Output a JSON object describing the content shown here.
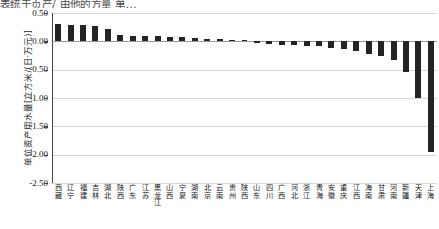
{
  "top_caption": "表统于页产/ 由他的方量 单...",
  "axes": {
    "ylabel": "单位资产用水量[立方米/(日·万元)]",
    "xlabel": "",
    "yticks": [
      0.5,
      0.0,
      -0.5,
      -1.0,
      -1.5,
      -2.0,
      -2.5
    ],
    "ytick_labels": [
      "0.50",
      "0.00",
      "-0.50",
      "-1.00",
      "-1.50",
      "-2.00",
      "-2.50"
    ],
    "ylim": [
      -2.5,
      0.5
    ],
    "grid": "horizontal"
  },
  "style": {
    "bar_color": "#242424",
    "grid_color": "#d6d6d6",
    "axis_color": "#444444",
    "background": "#ffffff"
  },
  "chart_data": {
    "type": "bar",
    "title": "",
    "xlabel": "",
    "ylabel": "单位资产用水量[立方米/(日·万元)]",
    "ylim": [
      -2.5,
      0.5
    ],
    "grid": true,
    "legend": "none",
    "orientation": "vertical",
    "categories": [
      "西藏",
      "辽宁",
      "福建",
      "吉林",
      "湖北",
      "陕西",
      "广东",
      "江苏",
      "黑龙江",
      "山西",
      "宁夏",
      "湖南",
      "北京",
      "云南",
      "贵州",
      "陕西",
      "山东",
      "四川",
      "广西",
      "河北",
      "浙江",
      "青海",
      "安徽",
      "重庆",
      "江西",
      "海南",
      "甘肃",
      "河南",
      "新疆",
      "天津",
      "上海"
    ],
    "values": [
      0.3,
      0.29,
      0.28,
      0.27,
      0.21,
      0.12,
      0.1,
      0.1,
      0.09,
      0.08,
      0.07,
      0.06,
      0.05,
      0.04,
      0.03,
      0.02,
      -0.03,
      -0.05,
      -0.06,
      -0.07,
      -0.08,
      -0.09,
      -0.11,
      -0.13,
      -0.17,
      -0.22,
      -0.26,
      -0.33,
      -0.55,
      -1.0,
      -1.95
    ]
  }
}
